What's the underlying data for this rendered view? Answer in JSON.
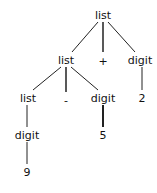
{
  "diagram": {
    "type": "parse-tree",
    "nodes": [
      {
        "id": "n0",
        "label": "list",
        "x": 103,
        "y": 15
      },
      {
        "id": "n1",
        "label": "list",
        "x": 66,
        "y": 60
      },
      {
        "id": "n2",
        "label": "+",
        "x": 103,
        "y": 61
      },
      {
        "id": "n3",
        "label": "digit",
        "x": 140,
        "y": 60
      },
      {
        "id": "n4",
        "label": "list",
        "x": 28,
        "y": 98
      },
      {
        "id": "n5",
        "label": "-",
        "x": 66,
        "y": 100
      },
      {
        "id": "n6",
        "label": "digit",
        "x": 103,
        "y": 98
      },
      {
        "id": "n7",
        "label": "2",
        "x": 142,
        "y": 98
      },
      {
        "id": "n8",
        "label": "digit",
        "x": 27,
        "y": 135
      },
      {
        "id": "n9",
        "label": "5",
        "x": 103,
        "y": 135
      },
      {
        "id": "n10",
        "label": "9",
        "x": 27,
        "y": 172
      }
    ],
    "edges": [
      [
        "n0",
        "n1"
      ],
      [
        "n0",
        "n2"
      ],
      [
        "n0",
        "n3"
      ],
      [
        "n1",
        "n4"
      ],
      [
        "n1",
        "n5"
      ],
      [
        "n1",
        "n6"
      ],
      [
        "n3",
        "n7"
      ],
      [
        "n4",
        "n8"
      ],
      [
        "n6",
        "n9"
      ],
      [
        "n8",
        "n10"
      ]
    ]
  }
}
